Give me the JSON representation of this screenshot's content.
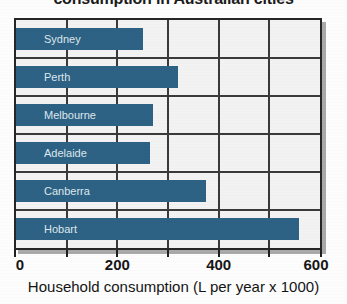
{
  "chart_data": {
    "type": "bar",
    "orientation": "horizontal",
    "title": "consumption in Australian cities",
    "xlabel": "Household consumption (L per year x 1000)",
    "ylabel": "",
    "categories": [
      "Sydney",
      "Perth",
      "Melbourne",
      "Adelaide",
      "Canberra",
      "Hobart"
    ],
    "values": [
      250,
      320,
      270,
      265,
      375,
      558
    ],
    "xlim": [
      0,
      600
    ],
    "xticks": [
      0,
      200,
      400,
      600
    ],
    "xtick_labels": [
      "0",
      "200",
      "400",
      "600"
    ],
    "minor_gridlines": [
      100,
      300,
      500
    ],
    "grid": true,
    "legend": "none",
    "series": [
      {
        "name": "Household consumption",
        "values": [
          250,
          320,
          270,
          265,
          375,
          558
        ]
      }
    ],
    "bar_color": "#2d6285",
    "plot_background": "#f2f2f2",
    "axis_color": "#262626",
    "bar_label_color": "#dfe7ec"
  },
  "axis": {
    "x_title": "Household consumption (L per year x 1000)",
    "ticks": [
      "0",
      "200",
      "400",
      "600"
    ]
  },
  "bars": [
    {
      "label": "Sydney",
      "value": 250
    },
    {
      "label": "Perth",
      "value": 320
    },
    {
      "label": "Melbourne",
      "value": 270
    },
    {
      "label": "Adelaide",
      "value": 265
    },
    {
      "label": "Canberra",
      "value": 375
    },
    {
      "label": "Hobart",
      "value": 558
    }
  ],
  "title": {
    "text": "consumption in Australian cities"
  }
}
